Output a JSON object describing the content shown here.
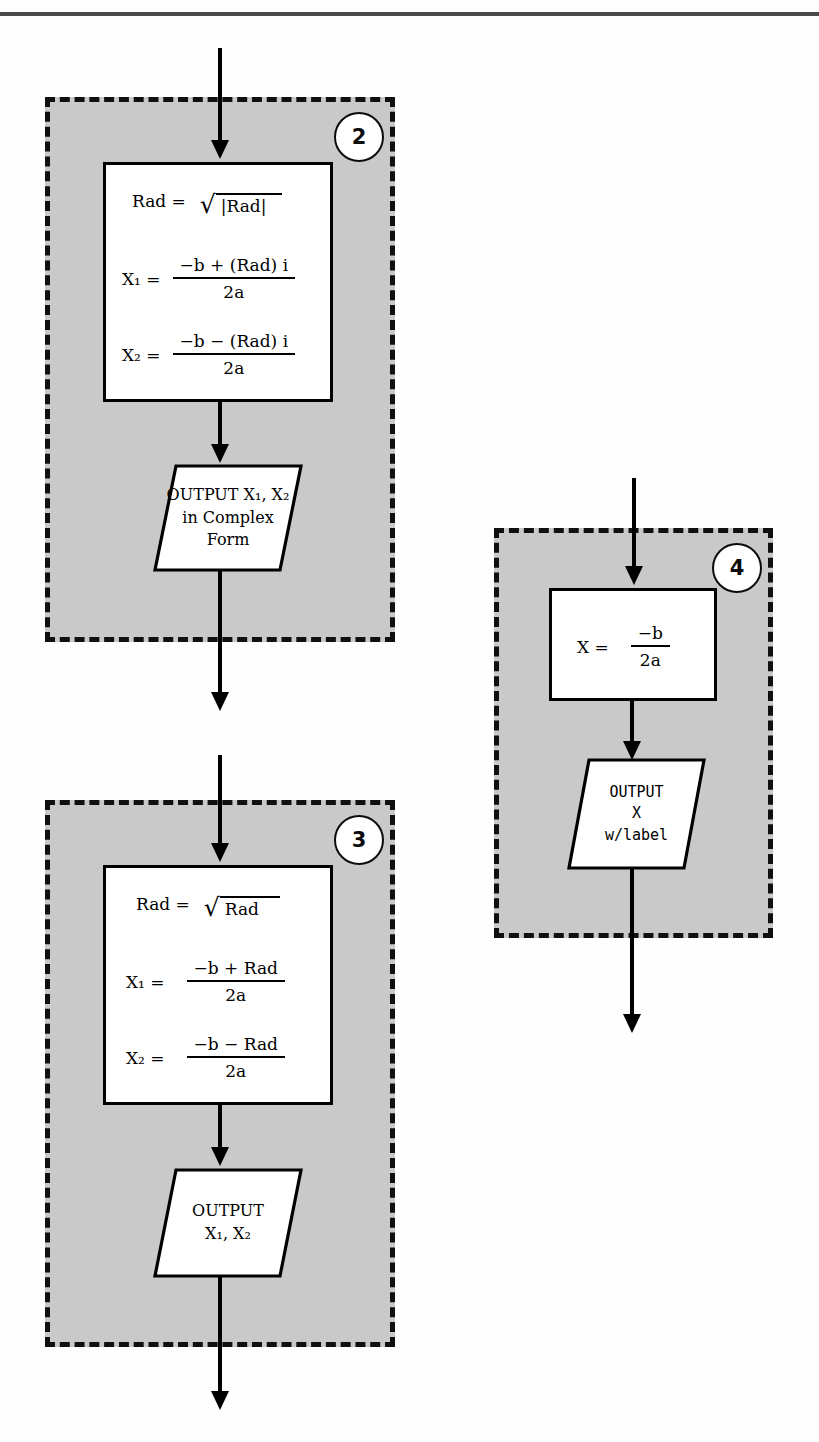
{
  "page": {
    "top_rule": true
  },
  "blocks": [
    {
      "id": "block-2",
      "badge": "2",
      "process": {
        "radical_lhs": "Rad =",
        "radical_arg": "|Rad|",
        "equations": [
          {
            "lhs": "X₁ =",
            "numerator": "−b + (Rad) i",
            "denominator": "2a"
          },
          {
            "lhs": "X₂ =",
            "numerator": "−b − (Rad) i",
            "denominator": "2a"
          }
        ]
      },
      "output": {
        "lines": [
          "OUTPUT X₁, X₂",
          "in Complex",
          "Form"
        ]
      }
    },
    {
      "id": "block-3",
      "badge": "3",
      "process": {
        "radical_lhs": "Rad =",
        "radical_arg": "Rad",
        "equations": [
          {
            "lhs": "X₁ =",
            "numerator": "−b + Rad",
            "denominator": "2a"
          },
          {
            "lhs": "X₂ =",
            "numerator": "−b − Rad",
            "denominator": "2a"
          }
        ]
      },
      "output": {
        "lines": [
          "OUTPUT",
          "X₁, X₂"
        ]
      }
    },
    {
      "id": "block-4",
      "badge": "4",
      "process": {
        "equation": {
          "lhs": "X =",
          "numerator": "−b",
          "denominator": "2a"
        }
      },
      "output": {
        "lines": [
          "OUTPUT",
          "X",
          "w/label"
        ]
      }
    }
  ],
  "colors": {
    "panel_fill": "#c9c9c9",
    "panel_border": "#101010",
    "shape_fill": "#ffffff",
    "ink": "#000000",
    "rule": "#4a4a4a"
  }
}
